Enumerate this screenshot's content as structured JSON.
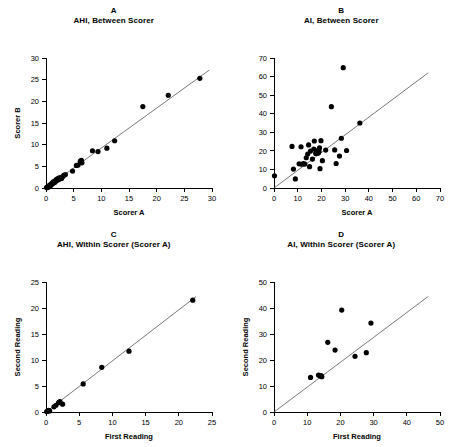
{
  "figure": {
    "background": "#ffffff",
    "point_color": "#000000",
    "line_color": "#555555"
  },
  "panels": [
    {
      "letter": "A",
      "title": "AHI, Between Scorer",
      "chart_data": {
        "type": "scatter",
        "title": "AHI, Between Scorer",
        "xlabel": "Scorer A",
        "ylabel": "Scorer B",
        "xlim": [
          0,
          30
        ],
        "ylim": [
          0,
          30
        ],
        "xticks": [
          0,
          5,
          10,
          15,
          20,
          25,
          30
        ],
        "yticks": [
          0,
          5,
          10,
          15,
          20,
          25,
          30
        ],
        "grid": false,
        "legend": "none",
        "fit_line": {
          "x0": 0,
          "y0": 0,
          "x1": 29.5,
          "y1": 27.2
        },
        "points": [
          {
            "x": 0.1,
            "y": 0.1
          },
          {
            "x": 0.2,
            "y": 0.2
          },
          {
            "x": 0.3,
            "y": 0.1
          },
          {
            "x": 0.4,
            "y": 0.4
          },
          {
            "x": 0.5,
            "y": 0.3
          },
          {
            "x": 0.6,
            "y": 0.6
          },
          {
            "x": 0.8,
            "y": 0.5
          },
          {
            "x": 0.9,
            "y": 0.9
          },
          {
            "x": 1.0,
            "y": 0.8
          },
          {
            "x": 1.1,
            "y": 1.1
          },
          {
            "x": 1.2,
            "y": 1.0
          },
          {
            "x": 1.3,
            "y": 1.4
          },
          {
            "x": 1.4,
            "y": 1.2
          },
          {
            "x": 1.5,
            "y": 1.5
          },
          {
            "x": 1.6,
            "y": 1.3
          },
          {
            "x": 1.7,
            "y": 1.7
          },
          {
            "x": 1.8,
            "y": 1.6
          },
          {
            "x": 1.9,
            "y": 2.0
          },
          {
            "x": 2.0,
            "y": 1.8
          },
          {
            "x": 2.1,
            "y": 2.1
          },
          {
            "x": 2.2,
            "y": 1.9
          },
          {
            "x": 2.3,
            "y": 2.3
          },
          {
            "x": 2.4,
            "y": 2.0
          },
          {
            "x": 2.6,
            "y": 2.4
          },
          {
            "x": 2.8,
            "y": 2.2
          },
          {
            "x": 3.0,
            "y": 2.6
          },
          {
            "x": 3.2,
            "y": 2.9
          },
          {
            "x": 3.5,
            "y": 3.1
          },
          {
            "x": 4.8,
            "y": 3.9
          },
          {
            "x": 5.5,
            "y": 5.2
          },
          {
            "x": 5.8,
            "y": 5.3
          },
          {
            "x": 6.2,
            "y": 6.2
          },
          {
            "x": 6.4,
            "y": 6.4
          },
          {
            "x": 6.5,
            "y": 5.8
          },
          {
            "x": 8.4,
            "y": 8.6
          },
          {
            "x": 9.4,
            "y": 8.4
          },
          {
            "x": 11.0,
            "y": 9.2
          },
          {
            "x": 12.4,
            "y": 10.9
          },
          {
            "x": 17.5,
            "y": 18.8
          },
          {
            "x": 22.1,
            "y": 21.4
          },
          {
            "x": 27.8,
            "y": 25.3
          }
        ]
      }
    },
    {
      "letter": "B",
      "title": "AI, Between Scorer",
      "chart_data": {
        "type": "scatter",
        "title": "AI, Between Scorer",
        "xlabel": "Scorer A",
        "ylabel": "",
        "xlim": [
          0,
          70
        ],
        "ylim": [
          0,
          70
        ],
        "xticks": [
          0,
          10,
          20,
          30,
          40,
          50,
          60,
          70
        ],
        "yticks": [
          0,
          10,
          20,
          30,
          40,
          50,
          60,
          70
        ],
        "grid": false,
        "legend": "none",
        "fit_line": {
          "x0": 0,
          "y0": 0,
          "x1": 65,
          "y1": 62
        },
        "points": [
          {
            "x": 0.2,
            "y": 6.6
          },
          {
            "x": 7.6,
            "y": 22.4
          },
          {
            "x": 8.2,
            "y": 10.2
          },
          {
            "x": 9.0,
            "y": 4.9
          },
          {
            "x": 10.6,
            "y": 13.0
          },
          {
            "x": 11.4,
            "y": 22.2
          },
          {
            "x": 11.8,
            "y": 12.8
          },
          {
            "x": 12.4,
            "y": 13.2
          },
          {
            "x": 13.0,
            "y": 12.9
          },
          {
            "x": 13.6,
            "y": 16.3
          },
          {
            "x": 14.2,
            "y": 18.3
          },
          {
            "x": 14.6,
            "y": 23.2
          },
          {
            "x": 15.0,
            "y": 11.5
          },
          {
            "x": 15.4,
            "y": 19.9
          },
          {
            "x": 16.2,
            "y": 15.6
          },
          {
            "x": 16.8,
            "y": 21.0
          },
          {
            "x": 17.0,
            "y": 25.3
          },
          {
            "x": 17.6,
            "y": 18.6
          },
          {
            "x": 17.9,
            "y": 19.3
          },
          {
            "x": 18.2,
            "y": 19.0
          },
          {
            "x": 18.4,
            "y": 20.1
          },
          {
            "x": 18.7,
            "y": 18.8
          },
          {
            "x": 19.0,
            "y": 19.6
          },
          {
            "x": 19.2,
            "y": 21.6
          },
          {
            "x": 19.4,
            "y": 10.4
          },
          {
            "x": 19.8,
            "y": 25.5
          },
          {
            "x": 20.4,
            "y": 14.7
          },
          {
            "x": 21.8,
            "y": 20.4
          },
          {
            "x": 24.2,
            "y": 43.8
          },
          {
            "x": 25.6,
            "y": 20.5
          },
          {
            "x": 26.2,
            "y": 13.2
          },
          {
            "x": 27.6,
            "y": 17.2
          },
          {
            "x": 28.4,
            "y": 26.8
          },
          {
            "x": 29.2,
            "y": 64.8
          },
          {
            "x": 30.6,
            "y": 20.2
          },
          {
            "x": 36.2,
            "y": 35.0
          }
        ]
      }
    },
    {
      "letter": "C",
      "title": "AHI, Within Scorer (Scorer A)",
      "chart_data": {
        "type": "scatter",
        "title": "AHI, Within Scorer (Scorer A)",
        "xlabel": "First Reading",
        "ylabel": "Second Reading",
        "xlim": [
          0,
          25
        ],
        "ylim": [
          0,
          25
        ],
        "xticks": [
          0,
          5,
          10,
          15,
          20,
          25
        ],
        "yticks": [
          0,
          5,
          10,
          15,
          20,
          25
        ],
        "grid": false,
        "legend": "none",
        "fit_line": {
          "x0": 0,
          "y0": 0,
          "x1": 22.6,
          "y1": 22.2
        },
        "points": [
          {
            "x": 0.1,
            "y": 0.1
          },
          {
            "x": 0.25,
            "y": 0.15
          },
          {
            "x": 0.4,
            "y": 0.3
          },
          {
            "x": 0.55,
            "y": 0.2
          },
          {
            "x": 1.2,
            "y": 1.0
          },
          {
            "x": 1.5,
            "y": 1.3
          },
          {
            "x": 1.9,
            "y": 1.8
          },
          {
            "x": 2.0,
            "y": 1.9
          },
          {
            "x": 2.1,
            "y": 2.0
          },
          {
            "x": 2.5,
            "y": 1.5
          },
          {
            "x": 5.6,
            "y": 5.4
          },
          {
            "x": 8.4,
            "y": 8.6
          },
          {
            "x": 12.5,
            "y": 11.7
          },
          {
            "x": 22.1,
            "y": 21.5
          }
        ]
      }
    },
    {
      "letter": "D",
      "title": "AI, Within Scorer (Scorer A)",
      "chart_data": {
        "type": "scatter",
        "title": "AI, Within Scorer (Scorer A)",
        "xlabel": "First Reading",
        "ylabel": "Second Reading",
        "xlim": [
          0,
          50
        ],
        "ylim": [
          0,
          50
        ],
        "xticks": [
          0,
          10,
          20,
          30,
          40,
          50
        ],
        "yticks": [
          0,
          10,
          20,
          30,
          40,
          50
        ],
        "grid": false,
        "legend": "none",
        "fit_line": {
          "x0": 0,
          "y0": 0,
          "x1": 46.5,
          "y1": 44.5
        },
        "points": [
          {
            "x": 11.0,
            "y": 13.3
          },
          {
            "x": 13.4,
            "y": 14.2
          },
          {
            "x": 13.9,
            "y": 13.8
          },
          {
            "x": 14.2,
            "y": 14.0
          },
          {
            "x": 14.4,
            "y": 13.6
          },
          {
            "x": 16.2,
            "y": 26.8
          },
          {
            "x": 18.4,
            "y": 23.8
          },
          {
            "x": 20.4,
            "y": 39.2
          },
          {
            "x": 24.4,
            "y": 21.4
          },
          {
            "x": 27.8,
            "y": 22.8
          },
          {
            "x": 29.2,
            "y": 34.2
          }
        ]
      }
    }
  ]
}
